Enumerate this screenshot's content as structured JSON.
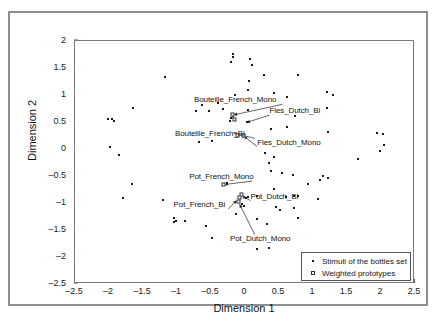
{
  "chart_data": {
    "type": "scatter",
    "title": "",
    "xlabel": "Dimension 1",
    "ylabel": "Dimension 2",
    "xlim": [
      -2.5,
      2.5
    ],
    "ylim": [
      -2.5,
      2.0
    ],
    "xticks": [
      "-2.5",
      "-2",
      "-1.5",
      "-1",
      "-0.5",
      "0",
      "0.5",
      "1",
      "1.5",
      "2",
      "2.5"
    ],
    "xtick_values": [
      -2.5,
      -2,
      -1.5,
      -1,
      -0.5,
      0,
      0.5,
      1,
      1.5,
      2,
      2.5
    ],
    "yticks": [
      "2",
      "1.5",
      "1",
      "0.5",
      "0",
      "-0.5",
      "-1",
      "-1.5",
      "-2",
      "-2.5"
    ],
    "ytick_values": [
      2,
      1.5,
      1,
      0.5,
      0,
      -0.5,
      -1,
      -1.5,
      -2,
      -2.5
    ],
    "grid": false,
    "legend_position": "bottom-right",
    "series": [
      {
        "name": "Stimuli of the bottles set",
        "marker": "dot",
        "points": [
          [
            -0.18,
            1.76
          ],
          [
            -0.18,
            1.7
          ],
          [
            -0.2,
            1.62
          ],
          [
            0.07,
            1.67
          ],
          [
            0.1,
            1.55
          ],
          [
            -1.18,
            1.33
          ],
          [
            0.28,
            1.37
          ],
          [
            0.78,
            1.37
          ],
          [
            0.06,
            1.26
          ],
          [
            0.04,
            1.1
          ],
          [
            0.42,
            1.03
          ],
          [
            1.2,
            1.06
          ],
          [
            1.3,
            1.0
          ],
          [
            -0.14,
            1.0
          ],
          [
            0.62,
            0.97
          ],
          [
            -1.65,
            0.76
          ],
          [
            -0.63,
            0.82
          ],
          [
            -0.72,
            0.7
          ],
          [
            -0.53,
            0.7
          ],
          [
            -0.33,
            0.74
          ],
          [
            0.05,
            0.72
          ],
          [
            1.2,
            0.76
          ],
          [
            0.73,
            0.61
          ],
          [
            -0.18,
            0.6
          ],
          [
            -2.02,
            0.56
          ],
          [
            -1.96,
            0.55
          ],
          [
            -1.93,
            0.51
          ],
          [
            -0.2,
            0.57
          ],
          [
            -0.22,
            0.52
          ],
          [
            0.03,
            0.5
          ],
          [
            -0.68,
            0.13
          ],
          [
            1.22,
            0.31
          ],
          [
            1.94,
            0.3
          ],
          [
            2.03,
            0.27
          ],
          [
            -0.48,
            0.15
          ],
          [
            0.38,
            0.37
          ],
          [
            -1.98,
            0.03
          ],
          [
            2.05,
            0.08
          ],
          [
            -0.03,
            0.23
          ],
          [
            1.99,
            -0.03
          ],
          [
            -1.86,
            -0.12
          ],
          [
            0.3,
            -0.08
          ],
          [
            0.42,
            -0.15
          ],
          [
            0.35,
            -0.25
          ],
          [
            1.66,
            -0.19
          ],
          [
            0.38,
            -0.4
          ],
          [
            0.55,
            -0.44
          ],
          [
            0.7,
            -0.49
          ],
          [
            -1.66,
            -0.64
          ],
          [
            1.1,
            -0.58
          ],
          [
            1.22,
            -0.53
          ],
          [
            1.14,
            -0.5
          ],
          [
            -1.8,
            -0.9
          ],
          [
            0.42,
            -0.74
          ],
          [
            -1.2,
            -0.95
          ],
          [
            0.18,
            -0.87
          ],
          [
            0.6,
            -0.89
          ],
          [
            0.72,
            -0.87
          ],
          [
            0.78,
            -0.87
          ],
          [
            1.08,
            -0.92
          ],
          [
            0.05,
            -0.88
          ],
          [
            -0.08,
            -0.93
          ],
          [
            -0.05,
            -1.02
          ],
          [
            0.46,
            -1.08
          ],
          [
            0.72,
            -1.1
          ],
          [
            0.52,
            -1.13
          ],
          [
            -0.13,
            -1.2
          ],
          [
            -1.04,
            -1.28
          ],
          [
            -1.01,
            -1.33
          ],
          [
            -1.05,
            -1.35
          ],
          [
            -0.88,
            -1.33
          ],
          [
            0.78,
            -1.28
          ],
          [
            0.18,
            -1.3
          ],
          [
            0.32,
            -1.38
          ],
          [
            -0.58,
            -1.43
          ],
          [
            -0.48,
            -1.65
          ],
          [
            0.18,
            -1.85
          ],
          [
            0.35,
            -1.83
          ],
          [
            0.02,
            -0.9
          ],
          [
            -0.02,
            -1.06
          ],
          [
            -0.27,
            -0.63
          ],
          [
            0.92,
            -0.64
          ],
          [
            0.62,
            0.4
          ],
          [
            -0.4,
            0.85
          ]
        ]
      },
      {
        "name": "Weighted prototypes",
        "marker": "open-square",
        "points": [
          [
            -0.17,
            0.63
          ],
          [
            -0.14,
            0.54
          ],
          [
            -0.02,
            0.24
          ],
          [
            -0.1,
            0.25
          ],
          [
            -0.31,
            -0.66
          ],
          [
            -0.07,
            -0.9
          ],
          [
            -0.09,
            -0.98
          ],
          [
            -0.05,
            -0.86
          ]
        ]
      }
    ],
    "annotations": [
      {
        "text": "Bouteille_French_Mono",
        "label_x": -0.75,
        "label_y": 0.9,
        "target_x": -0.17,
        "target_y": 0.63,
        "align": "left"
      },
      {
        "text": "Fles_Dutch_Bi",
        "label_x": 0.36,
        "label_y": 0.7,
        "target_x": 0.02,
        "target_y": 0.49,
        "align": "left"
      },
      {
        "text": "Bouteille_French_Bi",
        "label_x": -1.03,
        "label_y": 0.27,
        "target_x": -0.17,
        "target_y": 0.3,
        "align": "left"
      },
      {
        "text": "Fles_Dutch_Mono",
        "label_x": 0.18,
        "label_y": 0.12,
        "target_x": -0.02,
        "target_y": 0.24,
        "align": "left"
      },
      {
        "text": "Pot_French_Mono",
        "label_x": -0.82,
        "label_y": -0.52,
        "target_x": -0.31,
        "target_y": -0.66,
        "align": "left"
      },
      {
        "text": "Pot_Dutch_Bi",
        "label_x": 0.08,
        "label_y": -0.88,
        "target_x": -0.05,
        "target_y": -0.87,
        "align": "left"
      },
      {
        "text": "Pot_French_Bi",
        "label_x": -1.05,
        "label_y": -1.04,
        "target_x": -0.12,
        "target_y": -0.95,
        "align": "left"
      },
      {
        "text": "Pot_Dutch_Mono",
        "label_x": -0.22,
        "label_y": -1.66,
        "target_x": -0.08,
        "target_y": -1.02,
        "align": "left"
      }
    ]
  },
  "legend": {
    "items": [
      {
        "label": "Stimuli of the bottles set",
        "marker": "dot"
      },
      {
        "label": "Weighted prototypes",
        "marker": "open-square"
      }
    ]
  },
  "colors": {
    "marker": "#1a1a1a",
    "axis": "#7a7a7a",
    "frame": "#8f8f93",
    "text": "#151515",
    "background": "#ffffff"
  }
}
